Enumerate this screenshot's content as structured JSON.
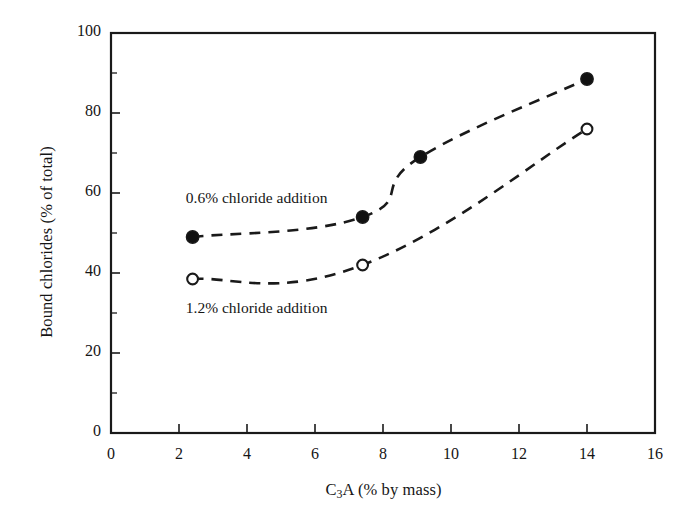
{
  "chart_data": {
    "type": "line",
    "title": "",
    "xlabel": "C3A (% by mass)",
    "xlabel_parts": {
      "pre": "C",
      "sub": "3",
      "post": "A (% by mass)"
    },
    "ylabel": "Bound chlorides (% of total)",
    "xlim": [
      0,
      16
    ],
    "ylim": [
      0,
      100
    ],
    "xticks": [
      0,
      2,
      4,
      6,
      8,
      10,
      12,
      14,
      16
    ],
    "yticks": [
      0,
      20,
      40,
      60,
      80,
      100
    ],
    "xtick_labels": [
      "0",
      "2",
      "4",
      "6",
      "8",
      "10",
      "12",
      "14",
      "16"
    ],
    "ytick_labels": [
      "0",
      "20",
      "40",
      "60",
      "80",
      "100"
    ],
    "grid": false,
    "legend_position": "inline-annotations",
    "line_style": "dashed",
    "line_color": "#1a1a1a",
    "series": [
      {
        "name": "0.6% chloride addition",
        "marker": "filled-circle",
        "marker_fill": "#111111",
        "points": [
          {
            "x": 2.4,
            "y": 49.0
          },
          {
            "x": 7.4,
            "y": 54.0
          },
          {
            "x": 9.1,
            "y": 69.0
          },
          {
            "x": 14.0,
            "y": 88.5
          }
        ]
      },
      {
        "name": "1.2% chloride addition",
        "marker": "open-circle",
        "marker_fill": "#ffffff",
        "points": [
          {
            "x": 2.4,
            "y": 38.5
          },
          {
            "x": 7.4,
            "y": 42.0
          },
          {
            "x": 14.0,
            "y": 76.0
          }
        ]
      }
    ],
    "annotations": [
      {
        "text": "0.6% chloride addition",
        "x": 2.2,
        "y": 58.5
      },
      {
        "text": "1.2% chloride addition",
        "x": 2.2,
        "y": 31.0
      }
    ]
  }
}
